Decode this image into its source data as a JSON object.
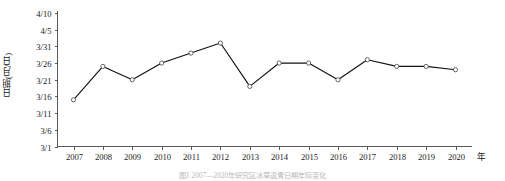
{
  "chart_data": {
    "type": "line",
    "title": "",
    "xlabel": "年",
    "ylabel": "日期(月/日)",
    "x_unit_label": "年",
    "categories": [
      "2007",
      "2008",
      "2009",
      "2010",
      "2011",
      "2012",
      "2013",
      "2014",
      "2015",
      "2016",
      "2017",
      "2018",
      "2019",
      "2020"
    ],
    "values": [
      "3/15",
      "3/25",
      "3/21",
      "3/26",
      "3/29",
      "4/1",
      "3/19",
      "3/26",
      "3/26",
      "3/21",
      "3/27",
      "3/25",
      "3/25",
      "3/24"
    ],
    "values_day_index": [
      15,
      25,
      21,
      26,
      29,
      32,
      19,
      26,
      26,
      21,
      27,
      25,
      25,
      24
    ],
    "ytick_labels": [
      "4/10",
      "4/5",
      "3/31",
      "3/26",
      "3/21",
      "3/16",
      "3/11",
      "3/6",
      "3/1"
    ],
    "ytick_day_index": [
      41,
      36,
      31,
      26,
      21,
      16,
      11,
      6,
      1
    ],
    "ylim_day_index": [
      1,
      41
    ],
    "xlim": [
      "2007",
      "2020"
    ],
    "grid": false,
    "legend": null,
    "marker": "open-circle",
    "line_color": "#111111",
    "marker_fill": "#ffffff",
    "marker_stroke": "#555555",
    "axis_color": "#5a5a5a"
  },
  "caption": {
    "text": "图1 2007—2020年研究区冰草返青日期年际变化"
  }
}
